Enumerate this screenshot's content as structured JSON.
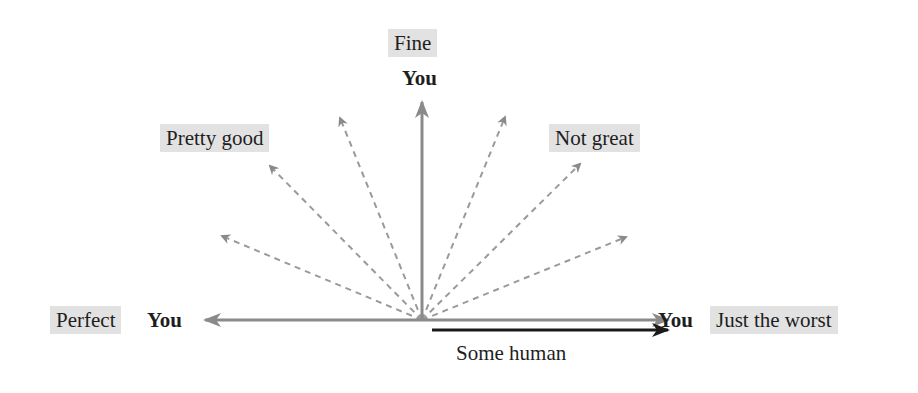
{
  "diagram": {
    "labels": {
      "top": "Fine",
      "upper_left": "Pretty good",
      "upper_right": "Not great",
      "left": "Perfect",
      "right": "Just the worst"
    },
    "you_label": "You",
    "human_label": "Some human",
    "colors": {
      "label_background": "#e2e2e2",
      "you_arrow": "#8a8a8a",
      "dashed_arrow": "#9a9a9a",
      "human_arrow": "#1a1a1a",
      "text": "#1e1e1e"
    },
    "origin": {
      "x": 422,
      "y": 320
    },
    "arrows": [
      {
        "name": "you-left",
        "to": [
          203,
          320
        ],
        "style": "solid-gray"
      },
      {
        "name": "you-up",
        "to": [
          422,
          100
        ],
        "style": "solid-gray"
      },
      {
        "name": "you-right",
        "to": [
          670,
          320
        ],
        "style": "solid-gray"
      },
      {
        "name": "human-right",
        "from": [
          432,
          330
        ],
        "to": [
          670,
          330
        ],
        "style": "solid-black"
      },
      {
        "name": "dashed-1",
        "to": [
          221,
          235
        ],
        "style": "dashed"
      },
      {
        "name": "dashed-2",
        "to": [
          339,
          116
        ],
        "style": "dashed"
      },
      {
        "name": "dashed-3",
        "to": [
          506,
          115
        ],
        "style": "dashed"
      },
      {
        "name": "dashed-4",
        "to": [
          627,
          236
        ],
        "style": "dashed"
      },
      {
        "name": "dashed-5",
        "to": [
          580,
          163
        ],
        "style": "dashed"
      }
    ]
  }
}
